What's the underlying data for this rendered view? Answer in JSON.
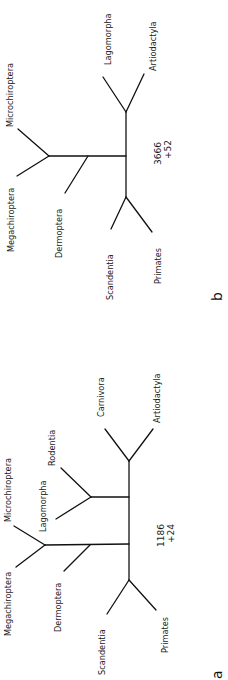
{
  "figure": {
    "panels": [
      {
        "id": "a",
        "label": "a",
        "score": "1186",
        "score_delta": "+24",
        "taxa": {
          "carnivora": "Carnivora",
          "artiodactyla": "Artiodactyla",
          "rodentia": "Rodentia",
          "lagomorpha": "Lagomorpha",
          "microchiroptera": "Microchiroptera",
          "megachiroptera": "Megachiroptera",
          "dermoptera": "Dermoptera",
          "scandentia": "Scandentia",
          "primates": "Primates"
        }
      },
      {
        "id": "b",
        "label": "b",
        "score": "3666",
        "score_delta": "+52",
        "taxa": {
          "lagomorpha": "Lagomorpha",
          "artiodactyla": "Artiodactyla",
          "microchiroptera": "Microchiroptera",
          "megachiroptera": "Megachiroptera",
          "dermoptera": "Dermoptera",
          "scandentia": "Scandentia",
          "primates": "Primates"
        }
      }
    ]
  }
}
